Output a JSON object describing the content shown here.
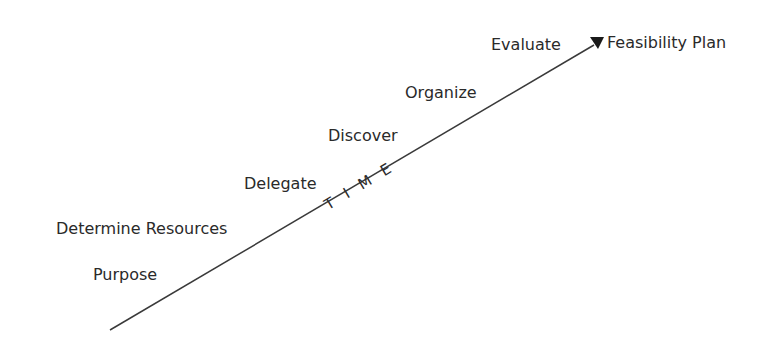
{
  "diagram": {
    "axis_label": "TIME",
    "end_label": "Feasibility Plan",
    "steps": [
      {
        "label": "Purpose"
      },
      {
        "label": "Determine Resources"
      },
      {
        "label": "Delegate"
      },
      {
        "label": "Discover"
      },
      {
        "label": "Organize"
      },
      {
        "label": "Evaluate"
      }
    ],
    "colors": {
      "line": "#3a3a3a",
      "text": "#2a2a2a"
    }
  }
}
